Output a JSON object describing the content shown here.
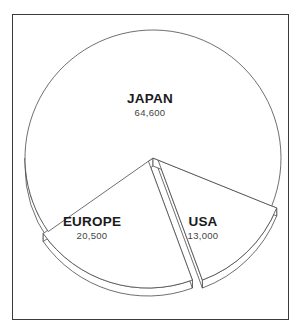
{
  "chart_data": {
    "type": "pie",
    "style": "3d-exploded",
    "title": "",
    "slices": [
      {
        "label": "JAPAN",
        "value": 64600,
        "value_label": "64,600"
      },
      {
        "label": "USA",
        "value": 13000,
        "value_label": "13,000"
      },
      {
        "label": "EUROPE",
        "value": 20500,
        "value_label": "20,500"
      }
    ],
    "legend": "none",
    "colors": {
      "fill": "#ffffff",
      "stroke": "#4a4a4a",
      "text": "#1a1a1a"
    }
  }
}
